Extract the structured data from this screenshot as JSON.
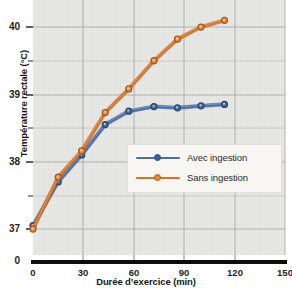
{
  "chart_data": {
    "type": "line",
    "title": "",
    "xlabel": "Durée d’exercice (min)",
    "ylabel": "Température rectale (°C)",
    "x": [
      0,
      15,
      29,
      43,
      57,
      72,
      86,
      100,
      114
    ],
    "xlim": [
      0,
      150
    ],
    "ylim": [
      36.55,
      40.35
    ],
    "xticks": [
      0,
      30,
      60,
      90,
      120,
      150
    ],
    "xtick_labels": [
      "0",
      "30",
      "60",
      "90",
      "120",
      "150"
    ],
    "yticks": [
      37,
      38,
      39,
      40
    ],
    "ytick_labels": [
      "37",
      "38",
      "39",
      "40"
    ],
    "y_origin_label": "0",
    "y_minor_gridlines": [
      37.5,
      38.5,
      39.5
    ],
    "grid": true,
    "legend_position": "center-right",
    "axis_break": true,
    "series": [
      {
        "name": "Avec ingestion",
        "color": "#4a6fa5",
        "marker": "circle",
        "values": [
          37.05,
          37.7,
          38.1,
          38.55,
          38.75,
          38.82,
          38.8,
          38.83,
          38.85
        ]
      },
      {
        "name": "Sans ingestion",
        "color": "#d4722a",
        "marker": "circle",
        "values": [
          37.0,
          37.77,
          38.16,
          38.73,
          39.08,
          39.5,
          39.82,
          40.0,
          40.1
        ]
      }
    ]
  },
  "legend": {
    "items": [
      {
        "label": "Avec ingestion",
        "color": "#4a6fa5"
      },
      {
        "label": "Sans ingestion",
        "color": "#d4722a"
      }
    ]
  },
  "axes": {
    "x_title": "Durée d’exercice (min)",
    "y_title": "Température rectale (°C)",
    "x_tick_0": "0",
    "x_tick_1": "30",
    "x_tick_2": "60",
    "x_tick_3": "90",
    "x_tick_4": "120",
    "x_tick_5": "150",
    "y_tick_0": "37",
    "y_tick_1": "38",
    "y_tick_2": "39",
    "y_tick_3": "40",
    "y_zero": "0"
  },
  "colors": {
    "series_blue": "#4a6fa5",
    "series_orange": "#d4722a",
    "plot_background": "#e9e9e7",
    "gridline": "#b9b9b6",
    "axis": "#101010"
  }
}
